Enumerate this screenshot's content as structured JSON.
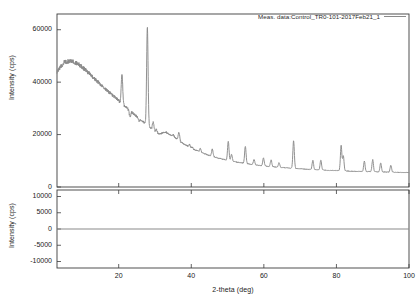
{
  "figure": {
    "title": "",
    "background_color": "#ffffff",
    "trace_color": "#8a8a8a",
    "axis_color": "#3c3c3c"
  },
  "legend": {
    "label": "Meas. data:Control_TR0-101-2017Feb21_1",
    "swatch_name": "legend-line-swatch",
    "position": "top-right"
  },
  "axes": {
    "x": {
      "label": "2-theta (deg)",
      "ticks": [
        "20",
        "40",
        "60",
        "80",
        "100"
      ],
      "tick_values": [
        20,
        40,
        60,
        80,
        100
      ],
      "range": [
        3,
        100
      ]
    },
    "y_top": {
      "label": "Intensity (cps)",
      "ticks": [
        "0",
        "20000",
        "40000",
        "60000"
      ],
      "tick_values": [
        0,
        20000,
        40000,
        60000
      ],
      "range": [
        0,
        66000
      ]
    },
    "y_bottom": {
      "label": "Intensity (cps)",
      "ticks": [
        "10000",
        "5000",
        "0",
        "-5000",
        "-10000"
      ],
      "tick_values": [
        10000,
        5000,
        0,
        -5000,
        -10000
      ],
      "range": [
        -12000,
        12000
      ]
    }
  },
  "chart_data": {
    "type": "line",
    "title": "",
    "xlabel": "2-theta (deg)",
    "ylabel": "Intensity (cps)",
    "xlim": [
      3,
      100
    ],
    "ylim": [
      0,
      66000
    ],
    "grid": false,
    "legend_position": "top-right",
    "series": [
      {
        "name": "Meas. data:Control_TR0-101-2017Feb21_1",
        "color": "#8a8a8a",
        "panel": "top",
        "background": {
          "x": [
            3,
            5,
            7,
            9,
            11,
            13,
            15,
            17,
            19,
            21,
            23,
            25,
            27,
            29,
            31,
            33,
            35,
            37,
            39,
            41,
            43,
            45,
            47,
            49,
            51,
            53,
            55,
            57,
            59,
            61,
            63,
            65,
            67,
            69,
            71,
            73,
            75,
            77,
            79,
            81,
            83,
            85,
            87,
            89,
            91,
            93,
            95,
            97,
            100
          ],
          "y": [
            44000,
            47600,
            48200,
            46800,
            44500,
            41800,
            39200,
            36600,
            34200,
            31700,
            29200,
            26900,
            24600,
            22200,
            20200,
            20900,
            19400,
            17200,
            15600,
            14200,
            13000,
            12000,
            11200,
            10500,
            9900,
            9400,
            8950,
            8550,
            8200,
            7900,
            7650,
            7420,
            7220,
            7030,
            6860,
            6700,
            6560,
            6430,
            6310,
            6200,
            6100,
            6010,
            5930,
            5860,
            5790,
            5730,
            5680,
            5630,
            5560
          ]
        },
        "peaks": [
          {
            "two_theta": 20.9,
            "intensity": 43500
          },
          {
            "two_theta": 23.1,
            "intensity": 26800
          },
          {
            "two_theta": 25.6,
            "intensity": 25200
          },
          {
            "two_theta": 27.9,
            "intensity": 61000
          },
          {
            "two_theta": 29.5,
            "intensity": 24800
          },
          {
            "two_theta": 30.4,
            "intensity": 22000
          },
          {
            "two_theta": 35.1,
            "intensity": 19800
          },
          {
            "two_theta": 36.6,
            "intensity": 21000
          },
          {
            "two_theta": 39.5,
            "intensity": 16200
          },
          {
            "two_theta": 40.3,
            "intensity": 15100
          },
          {
            "two_theta": 42.5,
            "intensity": 14600
          },
          {
            "two_theta": 45.8,
            "intensity": 14400
          },
          {
            "two_theta": 50.2,
            "intensity": 17400
          },
          {
            "two_theta": 51.1,
            "intensity": 12500
          },
          {
            "two_theta": 54.9,
            "intensity": 15600
          },
          {
            "two_theta": 57.3,
            "intensity": 10500
          },
          {
            "two_theta": 59.9,
            "intensity": 11100
          },
          {
            "two_theta": 62.0,
            "intensity": 10300
          },
          {
            "two_theta": 64.2,
            "intensity": 9300
          },
          {
            "two_theta": 68.2,
            "intensity": 17600
          },
          {
            "two_theta": 73.5,
            "intensity": 10100
          },
          {
            "two_theta": 75.7,
            "intensity": 10300
          },
          {
            "two_theta": 81.3,
            "intensity": 15800
          },
          {
            "two_theta": 81.9,
            "intensity": 11800
          },
          {
            "two_theta": 87.7,
            "intensity": 9800
          },
          {
            "two_theta": 90.0,
            "intensity": 10400
          },
          {
            "two_theta": 92.2,
            "intensity": 9200
          },
          {
            "two_theta": 95.0,
            "intensity": 8300
          }
        ]
      },
      {
        "name": "residual",
        "color": "#8a8a8a",
        "panel": "bottom",
        "constant_value": 0,
        "description": "flat line at zero"
      }
    ]
  }
}
